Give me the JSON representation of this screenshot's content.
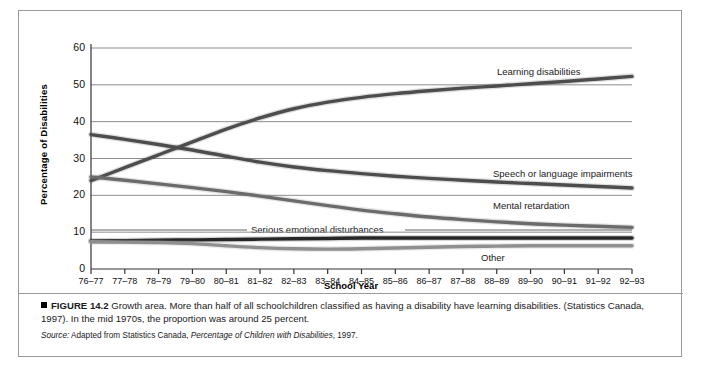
{
  "figure": {
    "number_label": "FIGURE 14.2",
    "caption_lead": "Growth area.",
    "caption_body": " More than half of all schoolchildren classified as having a disability have learning disabilities. (Statistics Canada, 1997). In the mid 1970s, the proportion was around 25 percent.",
    "source_prefix": "Source:",
    "source_text": " Adapted from Statistics Canada, ",
    "source_title": "Percentage of Children with Disabilities",
    "source_year": ", 1997."
  },
  "chart_data": {
    "type": "line",
    "title": "",
    "xlabel": "School Year",
    "ylabel": "Percentage of Disabilities",
    "ylim": [
      0,
      60
    ],
    "yticks": [
      0,
      10,
      20,
      30,
      40,
      50,
      60
    ],
    "grid": true,
    "legend_position": "inline-labels",
    "categories": [
      "76–77",
      "77–78",
      "78–79",
      "79–80",
      "80–81",
      "81–82",
      "82–83",
      "83–84",
      "84–85",
      "85–86",
      "86–87",
      "87–88",
      "88–89",
      "89–90",
      "90–91",
      "91–92",
      "92–93"
    ],
    "series": [
      {
        "name": "Learning disabilities",
        "color": "#4d4d4d",
        "values": [
          24.0,
          27.5,
          31.0,
          34.5,
          38.0,
          41.0,
          43.5,
          45.3,
          46.6,
          47.6,
          48.4,
          49.1,
          49.7,
          50.3,
          50.9,
          51.6,
          52.3
        ]
      },
      {
        "name": "Speech or language impairments",
        "color": "#4d4d4d",
        "values": [
          36.5,
          35.2,
          33.8,
          32.3,
          30.6,
          29.0,
          27.7,
          26.7,
          25.9,
          25.2,
          24.6,
          24.1,
          23.6,
          23.2,
          22.8,
          22.4,
          22.0
        ]
      },
      {
        "name": "Mental retardation",
        "color": "#6b6b6b",
        "values": [
          25.0,
          24.1,
          23.1,
          22.1,
          21.0,
          19.8,
          18.5,
          17.2,
          16.0,
          15.0,
          14.1,
          13.4,
          12.8,
          12.3,
          11.9,
          11.6,
          11.3
        ]
      },
      {
        "name": "Serious emotional disturbances",
        "color": "#262626",
        "values": [
          7.6,
          7.7,
          7.8,
          7.9,
          8.0,
          8.1,
          8.2,
          8.3,
          8.4,
          8.4,
          8.4,
          8.4,
          8.4,
          8.4,
          8.4,
          8.4,
          8.4
        ]
      },
      {
        "name": "Other",
        "color": "#8f8f8f",
        "values": [
          7.4,
          7.3,
          7.2,
          6.9,
          6.3,
          5.8,
          5.5,
          5.4,
          5.5,
          5.7,
          5.9,
          6.1,
          6.2,
          6.3,
          6.3,
          6.3,
          6.3
        ]
      }
    ],
    "annotations": [
      {
        "text": "Learning disabilities",
        "x": 476,
        "y": 55
      },
      {
        "text": "Speech or language impairments",
        "x": 472,
        "y": 157
      },
      {
        "text": "Mental retardation",
        "x": 472,
        "y": 189
      },
      {
        "text": "Serious emotional disturbances",
        "x": 230,
        "y": 213,
        "leader": "both"
      },
      {
        "text": "Other",
        "x": 460,
        "y": 241
      }
    ]
  }
}
